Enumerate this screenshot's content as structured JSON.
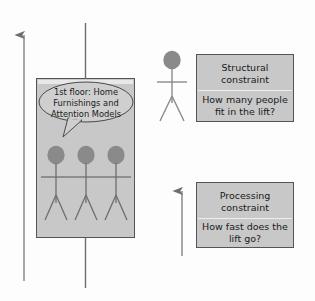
{
  "diagram": {
    "background_color": "#fdfdfd",
    "shape_fill": "#c8c8c8",
    "shape_stroke": "#545454",
    "line_color": "#6e6e6e",
    "figure_fill": "#8a8a8a"
  },
  "lift": {
    "name": "lift-car",
    "speech_bubble": {
      "line1": "1st floor: Home",
      "line2": "Furnishings and",
      "line3": "Attention Models"
    },
    "occupants": 3
  },
  "cable": {
    "upper_label": "lift cable above car",
    "lower_label": "lift cable below car"
  },
  "travel_arrow": {
    "label": "vertical travel arrow"
  },
  "waiting_person": {
    "label": "person waiting for lift"
  },
  "speed_arrow": {
    "label": "lift speed arrow"
  },
  "structural_constraint": {
    "title_line1": "Structural",
    "title_line2": "constraint",
    "question_line1": "How many people",
    "question_line2": "fit in the lift?"
  },
  "processing_constraint": {
    "title_line1": "Processing",
    "title_line2": "constraint",
    "question_line1": "How fast does the",
    "question_line2": "lift go?"
  }
}
